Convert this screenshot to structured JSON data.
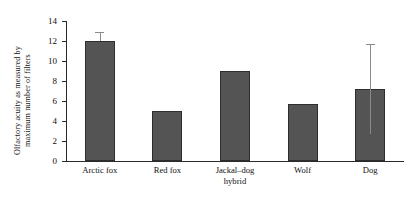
{
  "chart_data": {
    "type": "bar",
    "title": "",
    "xlabel": "",
    "ylabel_line1": "Olfactory acuity as measured by",
    "ylabel_line2": "maximum number of filters",
    "categories": [
      "Arctic fox",
      "Red fox",
      "Jackal–dog\nhybrid",
      "Wolf",
      "Dog"
    ],
    "values": [
      12.0,
      5.0,
      9.0,
      5.7,
      7.2
    ],
    "errors": [
      {
        "upper": 12.9,
        "lower": 12.0,
        "shown": true
      },
      {
        "upper": null,
        "lower": null,
        "shown": false
      },
      {
        "upper": null,
        "lower": null,
        "shown": false
      },
      {
        "upper": null,
        "lower": null,
        "shown": false
      },
      {
        "upper": 11.7,
        "lower": 2.7,
        "shown": true
      }
    ],
    "ylim": [
      0,
      14
    ],
    "yticks": [
      "0",
      "2",
      "4",
      "6",
      "8",
      "10",
      "12",
      "14"
    ],
    "ytick_values": [
      0,
      2,
      4,
      6,
      8,
      10,
      12,
      14
    ],
    "grid": false,
    "legend": null,
    "bar_color": "#545454",
    "bar_edge_color": "#2e2e2e",
    "error_color": "#8a8a8a",
    "axis_color": "#2b2b2b"
  }
}
